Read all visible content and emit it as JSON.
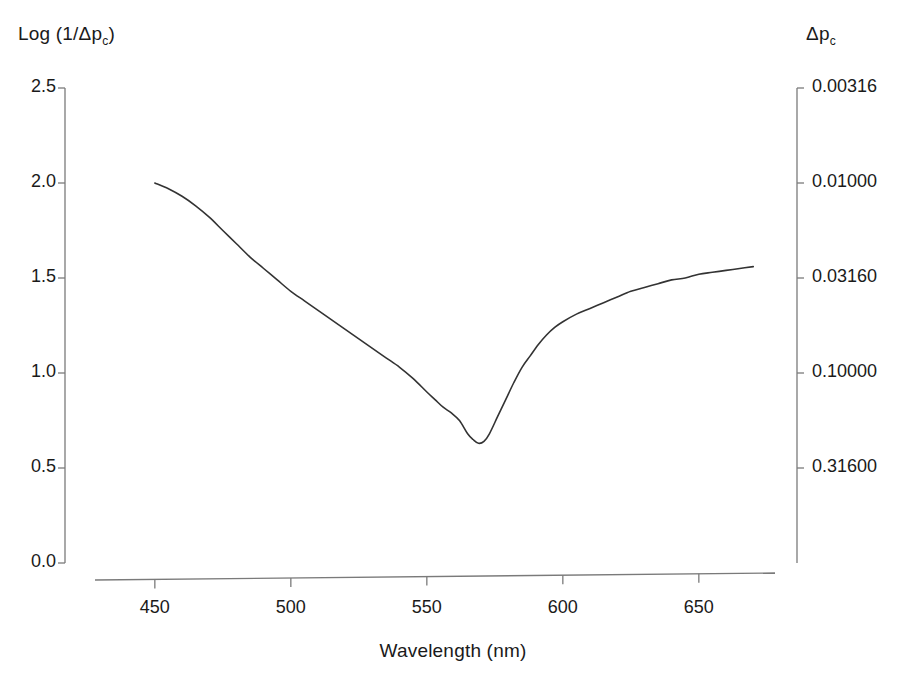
{
  "chart_data": {
    "type": "line",
    "title": "",
    "xlabel": "Wavelength (nm)",
    "ylabel": "Log (1/Δp_c)",
    "ylabel_right": "Δp_c",
    "xlim": [
      428,
      678
    ],
    "ylim": [
      0.0,
      2.5
    ],
    "xticks": [
      450,
      500,
      550,
      600,
      650
    ],
    "xticklabels": [
      "450",
      "500",
      "550",
      "600",
      "650"
    ],
    "yticks": [
      0.0,
      0.5,
      1.0,
      1.5,
      2.0,
      2.5
    ],
    "yticklabels": [
      "0.0",
      "0.5",
      "1.0",
      "1.5",
      "2.0",
      "2.5"
    ],
    "yticks_right": [
      0.5,
      1.0,
      1.5,
      2.0,
      2.5
    ],
    "yticklabels_right": [
      "0.31600",
      "0.10000",
      "0.03160",
      "0.01000",
      "0.00316"
    ],
    "grid": false,
    "legend": "none",
    "series": [
      {
        "name": "Log (1/Δp_c) vs Wavelength",
        "color": "#333333",
        "x": [
          450,
          455,
          460,
          465,
          470,
          475,
          480,
          485,
          490,
          495,
          500,
          505,
          510,
          515,
          520,
          525,
          530,
          535,
          540,
          545,
          550,
          553,
          556,
          559,
          562,
          565,
          567,
          569,
          571,
          573,
          576,
          579,
          582,
          585,
          588,
          591,
          594,
          597,
          600,
          605,
          610,
          615,
          620,
          625,
          630,
          635,
          640,
          645,
          650,
          655,
          660,
          665,
          670
        ],
        "y": [
          2.0,
          1.97,
          1.93,
          1.88,
          1.82,
          1.75,
          1.68,
          1.61,
          1.55,
          1.49,
          1.43,
          1.38,
          1.33,
          1.28,
          1.23,
          1.18,
          1.13,
          1.08,
          1.03,
          0.97,
          0.9,
          0.86,
          0.82,
          0.79,
          0.75,
          0.68,
          0.65,
          0.63,
          0.64,
          0.68,
          0.77,
          0.86,
          0.95,
          1.03,
          1.09,
          1.15,
          1.2,
          1.24,
          1.27,
          1.31,
          1.34,
          1.37,
          1.4,
          1.43,
          1.45,
          1.47,
          1.49,
          1.5,
          1.52,
          1.53,
          1.54,
          1.55,
          1.56
        ]
      }
    ]
  },
  "axes": {
    "left_title_main": "Log (1/Δp",
    "left_title_sub": "c",
    "left_title_close": ")",
    "right_title_main": "Δp",
    "right_title_sub": "c",
    "x_title": "Wavelength (nm)"
  },
  "colors": {
    "curve": "#333333",
    "axis": "#7a7a7a",
    "text": "#1a1a1a",
    "background": "#ffffff"
  }
}
